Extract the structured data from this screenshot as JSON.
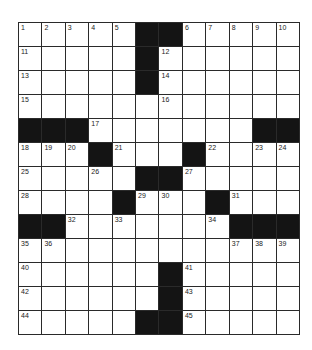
{
  "puzzle": {
    "cols": 12,
    "rows": 13,
    "colors": {
      "block": "#141414",
      "line": "#2a2a2a",
      "cell": "#ffffff"
    },
    "layout": [
      "....##.....",
      "",
      "",
      "",
      "",
      "",
      "",
      "",
      "",
      "",
      "",
      "",
      ""
    ],
    "grid": [
      [
        "1",
        "2",
        "3",
        "4",
        "5",
        "#",
        "#",
        "6",
        "7",
        "8",
        "9",
        "10"
      ],
      [
        "11",
        "",
        "",
        "",
        "",
        "#",
        "12",
        "",
        "",
        "",
        "",
        ""
      ],
      [
        "13",
        "",
        "",
        "",
        "",
        "#",
        "14",
        "",
        "",
        "",
        "",
        ""
      ],
      [
        "15",
        "",
        "",
        "",
        "",
        "",
        "16",
        "",
        "",
        "",
        "",
        ""
      ],
      [
        "#",
        "#",
        "#",
        "17",
        "",
        "",
        "",
        "",
        "",
        "",
        "#",
        "#"
      ],
      [
        "18",
        "19",
        "20",
        "#",
        "21",
        "",
        "",
        "#",
        "22",
        "",
        "23",
        "24"
      ],
      [
        "25",
        "",
        "",
        "26",
        "",
        "#",
        "#",
        "27",
        "",
        "",
        "",
        ""
      ],
      [
        "28",
        "",
        "",
        "",
        "#",
        "29",
        "30",
        "",
        "#",
        "31",
        "",
        ""
      ],
      [
        "#",
        "#",
        "32",
        "",
        "33",
        "",
        "",
        "",
        "34",
        "#",
        "#",
        "#"
      ],
      [
        "35",
        "36",
        "",
        "",
        "",
        "",
        "",
        "",
        "",
        "37",
        "38",
        "39"
      ],
      [
        "40",
        "",
        "",
        "",
        "",
        "",
        "#",
        "41",
        "",
        "",
        "",
        ""
      ],
      [
        "42",
        "",
        "",
        "",
        "",
        "",
        "#",
        "43",
        "",
        "",
        "",
        ""
      ],
      [
        "44",
        "",
        "",
        "",
        "",
        "#",
        "#",
        "45",
        "",
        "",
        "",
        ""
      ]
    ]
  }
}
